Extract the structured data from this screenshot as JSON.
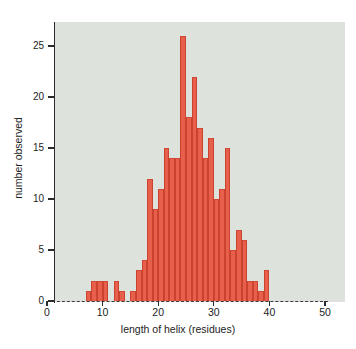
{
  "figure": {
    "background": "#ffffff",
    "panel_color": "#dde2dc",
    "bar_color": "#e8604c",
    "axis_color": "#2b2b2b"
  },
  "chart_data": {
    "type": "bar",
    "title": "",
    "xlabel": "length of helix (residues)",
    "ylabel": "number observed",
    "xlim": [
      0,
      50
    ],
    "ylim": [
      0,
      27
    ],
    "xticks": [
      0,
      10,
      20,
      30,
      40,
      50
    ],
    "xticklabels": [
      "0",
      "10",
      "20",
      "30",
      "40",
      "50"
    ],
    "yticks": [
      0,
      5,
      10,
      15,
      20,
      25
    ],
    "yticklabels": [
      "0",
      "5",
      "10",
      "15",
      "20",
      "25"
    ],
    "grid": false,
    "legend": null,
    "bin_width": 1,
    "categories": [
      7,
      8,
      9,
      10,
      11,
      12,
      13,
      14,
      15,
      16,
      17,
      18,
      19,
      20,
      21,
      22,
      23,
      24,
      25,
      26,
      27,
      28,
      29,
      30,
      31,
      32,
      33,
      34,
      35,
      36,
      37,
      38,
      39
    ],
    "values": [
      1,
      2,
      2,
      2,
      0,
      2,
      1,
      0,
      1,
      3,
      4,
      12,
      9,
      11,
      15,
      14,
      14,
      26,
      18,
      22,
      17,
      14,
      16,
      10,
      11,
      15,
      5,
      7,
      6,
      2,
      2,
      1,
      3
    ]
  }
}
